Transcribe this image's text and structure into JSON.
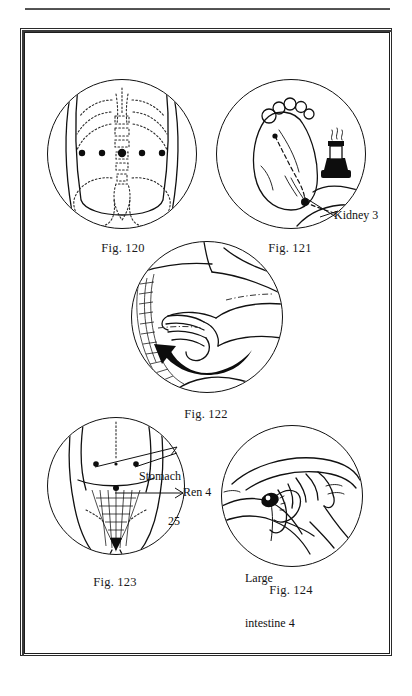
{
  "page": {
    "background": "#ffffff",
    "ink": "#111111",
    "has_top_rule": true,
    "frame": {
      "style": "double-rule-box",
      "color": "#2a2a2a"
    }
  },
  "figures": [
    {
      "id": "fig-120",
      "caption": "Fig. 120",
      "caption_prefix": "Fig.",
      "caption_number": "120",
      "subject": "lower back / lumbar region with five acupuncture points along the waist",
      "point_count": 5,
      "labels": []
    },
    {
      "id": "fig-121",
      "caption": "Fig. 121",
      "caption_prefix": "Fig.",
      "caption_number": "121",
      "subject": "sole of foot with moxa burner, dashed channel line",
      "point_count": 2,
      "labels": [
        {
          "id": "kidney-3",
          "text": "Kidney 3",
          "lines": [
            "Kidney 3"
          ]
        }
      ]
    },
    {
      "id": "fig-122",
      "caption": "Fig. 122",
      "caption_prefix": "Fig.",
      "caption_number": "122",
      "subject": "hand massaging abdomen with curved arrow showing circular direction",
      "labels": []
    },
    {
      "id": "fig-123",
      "caption": "Fig. 123",
      "caption_prefix": "Fig.",
      "caption_number": "123",
      "subject": "lower abdomen with acupuncture points",
      "point_count": 3,
      "labels": [
        {
          "id": "stomach-25",
          "text": "Stomach 25",
          "lines": [
            "Stomach",
            "25"
          ]
        },
        {
          "id": "ren-4",
          "text": "Ren 4",
          "lines": [
            "Ren 4"
          ]
        }
      ]
    },
    {
      "id": "fig-124",
      "caption": "Fig. 124",
      "caption_prefix": "Fig.",
      "caption_number": "124",
      "subject": "hand pressing the web between thumb and index finger",
      "labels": [
        {
          "id": "large-intestine-4",
          "text": "Large intestine 4",
          "lines": [
            "Large",
            "intestine 4"
          ]
        }
      ]
    }
  ]
}
